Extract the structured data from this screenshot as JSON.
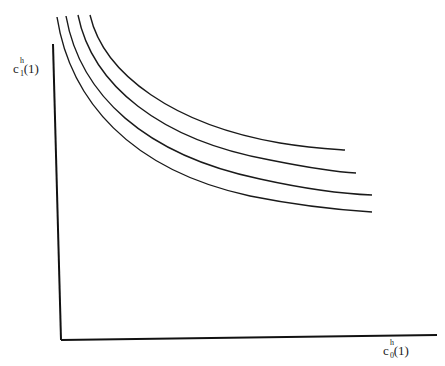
{
  "diagram": {
    "type": "indifference-curves",
    "y_axis": {
      "label_base": "c",
      "label_sup": "h",
      "label_sub": "1",
      "label_arg": "(1)"
    },
    "x_axis": {
      "label_base": "c",
      "label_sup": "h",
      "label_sub": "0",
      "label_arg": "(1)"
    },
    "curves": [
      {
        "name": "curve-1",
        "path": "M 57 17 C 70 100, 130 170, 250 196 C 300 206, 340 210, 372 212"
      },
      {
        "name": "curve-2",
        "path": "M 66 16 C 80 95, 145 155, 260 179 C 310 190, 345 194, 372 195"
      },
      {
        "name": "curve-3",
        "path": "M 78 15 C 92 85, 160 140, 270 160 C 310 168, 335 172, 356 173"
      },
      {
        "name": "curve-4",
        "path": "M 90 15 C 104 75, 175 125, 280 143 C 310 148, 330 149, 345 150"
      }
    ],
    "colors": {
      "line": "#1a1a1a",
      "axis": "#111111"
    }
  }
}
